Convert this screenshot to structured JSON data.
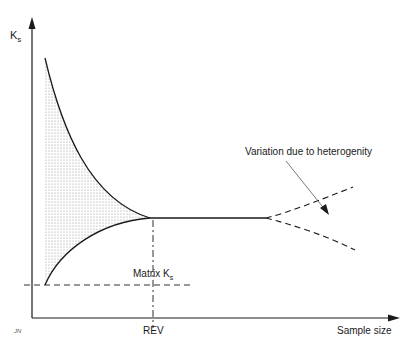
{
  "diagram": {
    "y_axis_label": "K",
    "y_axis_label_sub": "s",
    "x_axis_label": "Sample size",
    "rev_label": "REV",
    "matrix_label": "Matrix K",
    "matrix_label_sub": "s",
    "annotation": "Variation due to heterogenity",
    "signature": "JN"
  },
  "colors": {
    "line": "#1a1a1a",
    "shade_dots": "#8a8a8a",
    "background": "#ffffff"
  }
}
